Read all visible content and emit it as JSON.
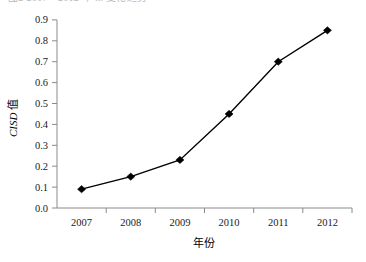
{
  "top_cropped_caption": "图2 2007—2012 年 ... 变化趋势",
  "chart_data": {
    "type": "line",
    "title": "",
    "xlabel": "年份",
    "ylabel_italic": "CISD",
    "ylabel_suffix": " 值",
    "categories": [
      "2007",
      "2008",
      "2009",
      "2010",
      "2011",
      "2012"
    ],
    "values": [
      0.09,
      0.15,
      0.23,
      0.45,
      0.7,
      0.85
    ],
    "series": [
      {
        "name": "CISD 值",
        "values": [
          0.09,
          0.15,
          0.23,
          0.45,
          0.7,
          0.85
        ]
      }
    ],
    "ylim": [
      0.0,
      0.9
    ],
    "ytick_step": 0.1,
    "yticks": [
      "0.0",
      "0.1",
      "0.2",
      "0.3",
      "0.4",
      "0.5",
      "0.6",
      "0.7",
      "0.8",
      "0.9"
    ],
    "grid": false,
    "legend": false,
    "legend_position": "none",
    "marker": "diamond",
    "line_color": "#000000",
    "marker_color": "#000000",
    "background_color": "#ffffff",
    "axis_color": "#8a8a8a"
  }
}
